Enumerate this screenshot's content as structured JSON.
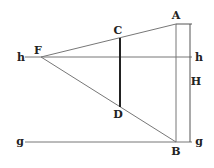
{
  "diagram": {
    "labels": {
      "A": "A",
      "B": "B",
      "C": "C",
      "D": "D",
      "F": "F",
      "H": "H",
      "h_left": "h",
      "h_right": "h",
      "g_left": "g",
      "g_right": "g"
    },
    "points": {
      "A": [
        176,
        24
      ],
      "B": [
        176,
        142
      ],
      "C": [
        120,
        38
      ],
      "D": [
        120,
        107
      ],
      "F": [
        41,
        57
      ]
    },
    "lines": {
      "horizon_h": {
        "y": 57,
        "x1": 25,
        "x2": 192
      },
      "ground_g": {
        "y": 142,
        "x1": 25,
        "x2": 192
      },
      "height_H": {
        "x": 190,
        "y1": 24,
        "y2": 142
      }
    },
    "colors": {
      "line": "#777777",
      "thick_line": "#222222",
      "text": "#222222"
    }
  }
}
